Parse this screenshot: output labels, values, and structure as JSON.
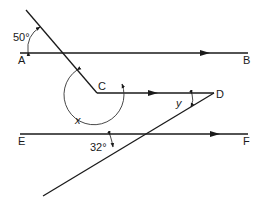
{
  "diagram": {
    "type": "geometry-parallel-lines-angles",
    "points": {
      "A": "A",
      "B": "B",
      "C": "C",
      "D": "D",
      "E": "E",
      "F": "F"
    },
    "angles": {
      "top": "50°",
      "bottom": "32°",
      "reflex_at_C": "x",
      "at_D": "y"
    },
    "colors": {
      "stroke": "#1a1a1a",
      "background": "#ffffff"
    }
  }
}
